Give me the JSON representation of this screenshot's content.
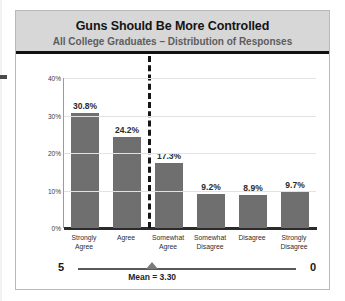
{
  "chart_data": {
    "type": "bar",
    "title": "Guns Should Be More Controlled",
    "subtitle": "All College Graduates – Distribution of Responses",
    "categories": [
      "Strongly Agree",
      "Agree",
      "Somewhat Agree",
      "Somewhat Disagree",
      "Disagree",
      "Strongly Disagree"
    ],
    "category_lines": [
      [
        "Strongly",
        "Agree"
      ],
      [
        "Agree"
      ],
      [
        "Somewhat",
        "Agree"
      ],
      [
        "Somewhat",
        "Disagree"
      ],
      [
        "Disagree"
      ],
      [
        "Strongly",
        "Disagree"
      ]
    ],
    "values": [
      30.8,
      24.2,
      17.3,
      9.2,
      8.9,
      9.7
    ],
    "value_labels": [
      "30.8%",
      "24.2%",
      "17.3%",
      "9.2%",
      "8.9%",
      "9.7%"
    ],
    "xlabel": "",
    "ylabel": "",
    "ylim": [
      0,
      40
    ],
    "ytick_values": [
      0,
      10,
      20,
      30,
      40
    ],
    "ytick_labels": [
      "0%",
      "10%",
      "20%",
      "30%",
      "40%"
    ],
    "grid": true,
    "legend": "none",
    "bar_color": "#6f6f6f",
    "annotations": {
      "divider_after_category_index": 1,
      "divider_style": "dashed-vertical",
      "scale_left_label": "5",
      "scale_right_label": "0",
      "mean_label": "Mean = 3.30",
      "mean_value": 3.3,
      "scale_min": 0,
      "scale_max": 5
    }
  },
  "header": {
    "band_color": "#d7d7d7",
    "rule_color": "#111111"
  }
}
